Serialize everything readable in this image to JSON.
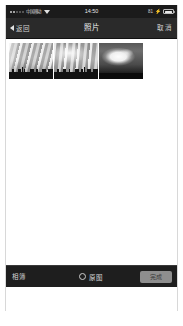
{
  "status_bar": {
    "carrier": "中国移动",
    "signal_dots": 5,
    "wifi_icon": "wifi-icon",
    "time": "14:50",
    "battery_percent": "81",
    "charging_icon": "bolt-icon",
    "battery_icon": "battery-icon"
  },
  "nav_bar": {
    "back_icon": "chevron-left-icon",
    "back_label": "返回",
    "title": "照片",
    "right_action": "取消"
  },
  "content": {
    "thumbnails": [
      {
        "alt": "多云天空与城市天际线",
        "style": "sky-a"
      },
      {
        "alt": "多云天空与城市天际线",
        "style": "sky-b"
      },
      {
        "alt": "明亮积云",
        "style": "sky-c"
      }
    ]
  },
  "toolbar": {
    "albums_label": "相簿",
    "original_radio_icon": "radio-unchecked-icon",
    "original_label": "原图",
    "done_label": "完成"
  },
  "colors": {
    "status_bar_bg": "#1b1b1b",
    "nav_bar_bg": "#2a2a2a",
    "toolbar_bg": "#1e1e1e",
    "content_bg": "#ffffff",
    "done_button_bg": "#8e8e8e",
    "nav_text": "#d6d6d6"
  }
}
